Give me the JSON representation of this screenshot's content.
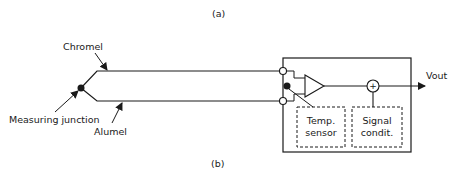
{
  "captions": {
    "top": "(a)",
    "bottom": "(b)"
  },
  "labels": {
    "chromel": "Chromel",
    "alumel": "Alumel",
    "measuring_junction": "Measuring junction",
    "vout": "Vout",
    "temp_sensor_line1": "Temp.",
    "temp_sensor_line2": "sensor",
    "signal_cond_line1": "Signal",
    "signal_cond_line2": "condit."
  },
  "symbols": {
    "summing_junction": "+"
  },
  "colors": {
    "line": "#1a1a1a",
    "background": "#ffffff"
  }
}
